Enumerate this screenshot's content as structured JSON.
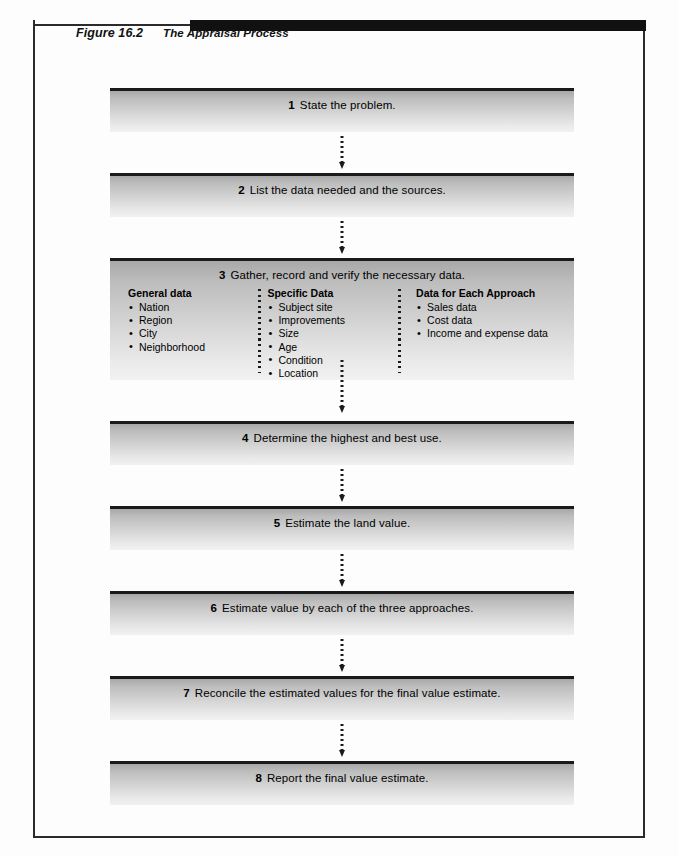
{
  "figure": {
    "label": "Figure 16.2",
    "title": "The Appraisal Process"
  },
  "colors": {
    "rule": "#111111",
    "box_border": "#1a1a1a",
    "box_gradient_top": "#a8a8a8",
    "box_gradient_bottom": "#f1f1f1",
    "frame": "#2b2b2b",
    "text": "#000000",
    "page_background": "#fdfdfd"
  },
  "flow": {
    "steps": [
      {
        "num": "1",
        "text": "State the problem."
      },
      {
        "num": "2",
        "text": "List the data needed and the sources."
      },
      {
        "num": "3",
        "text": "Gather, record and verify the necessary data."
      },
      {
        "num": "4",
        "text": "Determine the highest and best use."
      },
      {
        "num": "5",
        "text": "Estimate the land value."
      },
      {
        "num": "6",
        "text": "Estimate value by each of the three approaches."
      },
      {
        "num": "7",
        "text": "Reconcile the estimated values for the final value estimate."
      },
      {
        "num": "8",
        "text": "Report the final value estimate."
      }
    ],
    "step3_columns": [
      {
        "heading": "General data",
        "items": [
          "Nation",
          "Region",
          "City",
          "Neighborhood"
        ]
      },
      {
        "heading": "Specific Data",
        "items": [
          "Subject site",
          "Improvements",
          "Size",
          "Age",
          "Condition",
          "Location"
        ]
      },
      {
        "heading": "Data for Each Approach",
        "items": [
          "Sales data",
          "Cost data",
          "Income and expense data"
        ]
      }
    ]
  }
}
